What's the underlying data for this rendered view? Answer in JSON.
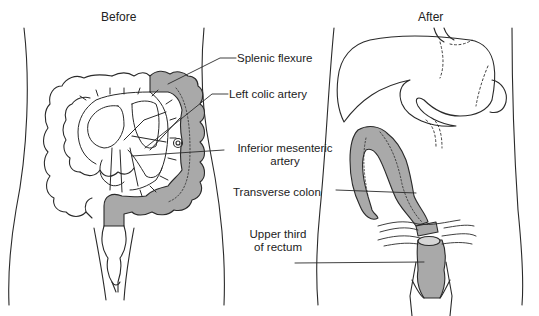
{
  "panels": {
    "before": {
      "title": "Before"
    },
    "after": {
      "title": "After"
    }
  },
  "labels": {
    "splenic_flexure": "Splenic flexure",
    "left_colic_artery": "Left colic artery",
    "inferior_mesenteric_line1": "Inferior mesenteric",
    "inferior_mesenteric_line2": "artery",
    "transverse_colon": "Transverse colon",
    "upper_third_line1": "Upper third",
    "upper_third_line2": "of rectum"
  },
  "colors": {
    "outline": "#2a2a2a",
    "resected_fill": "#a9a9a9",
    "background": "#ffffff"
  }
}
